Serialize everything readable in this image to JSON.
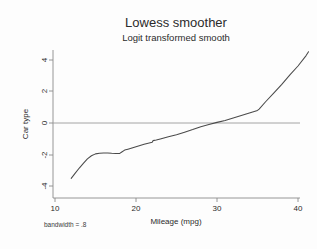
{
  "chart_data": {
    "type": "line",
    "title": "Lowess smoother",
    "subtitle": "Logit transformed smooth",
    "xlabel": "Mileage (mpg)",
    "ylabel": "Car type",
    "xlim": [
      10,
      41.5
    ],
    "ylim": [
      -4.2,
      4.8
    ],
    "xticks": [
      10,
      20,
      30,
      40
    ],
    "xtick_labels": [
      "10",
      "20",
      "30",
      "40"
    ],
    "yticks": [
      4,
      2,
      0,
      -2,
      -4
    ],
    "ytick_labels": [
      "4",
      "2",
      "0",
      "-2",
      "-4"
    ],
    "grid": false,
    "legend": null,
    "reference_lines": [
      {
        "axis": "y",
        "value": 0,
        "color": "#9a9a9a"
      }
    ],
    "annotations": [
      {
        "text": "bandwidth = .8",
        "position": "below-left"
      }
    ],
    "series": [
      {
        "name": "logit transformed lowess smooth",
        "color": "#4a4a4a",
        "x": [
          12.0,
          12.5,
          13.0,
          13.5,
          14.0,
          14.5,
          15.0,
          15.5,
          16.0,
          16.5,
          17.0,
          17.5,
          18.0,
          18.2,
          18.6,
          19.0,
          19.5,
          20.0,
          21.0,
          22.0,
          22.1,
          22.5,
          23.0,
          24.0,
          25.0,
          26.0,
          27.0,
          28.0,
          29.0,
          30.0,
          31.0,
          32.0,
          33.0,
          34.0,
          35.0,
          35.2,
          36.0,
          37.0,
          38.0,
          39.0,
          40.0,
          41.0,
          41.3
        ],
        "y": [
          -3.52,
          -3.18,
          -2.86,
          -2.56,
          -2.28,
          -2.08,
          -1.96,
          -1.92,
          -1.9,
          -1.9,
          -1.92,
          -1.93,
          -1.93,
          -1.86,
          -1.72,
          -1.66,
          -1.58,
          -1.5,
          -1.35,
          -1.22,
          -1.12,
          -1.08,
          -1.01,
          -0.88,
          -0.74,
          -0.58,
          -0.42,
          -0.24,
          -0.1,
          0.04,
          0.16,
          0.31,
          0.47,
          0.64,
          0.8,
          0.88,
          1.35,
          1.9,
          2.45,
          3.05,
          3.62,
          4.28,
          4.52
        ]
      }
    ]
  }
}
